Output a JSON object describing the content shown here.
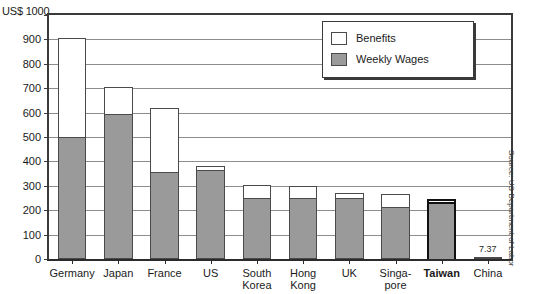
{
  "chart_data": {
    "type": "bar",
    "stacked": true,
    "title": "",
    "subtitle": "",
    "xlabel": "",
    "ylabel": "US$ 1000",
    "ylim": [
      0,
      1000
    ],
    "ytick_step": 100,
    "yticks": [
      0,
      100,
      200,
      300,
      400,
      500,
      600,
      700,
      800,
      900,
      1000
    ],
    "ytick_labels": [
      "0",
      "100",
      "200",
      "300",
      "400",
      "500",
      "600",
      "700",
      "800",
      "900",
      "1000"
    ],
    "grid": true,
    "grid_axis": "y",
    "legend_position": "top-right",
    "categories": [
      "Germany",
      "Japan",
      "France",
      "US",
      "South\nKorea",
      "Hong\nKong",
      "UK",
      "Singa-\npore",
      "Taiwan",
      "China"
    ],
    "series": [
      {
        "name": "Weekly Wages",
        "color": "#9a9a9a",
        "values": [
          500,
          595,
          355,
          365,
          250,
          250,
          250,
          215,
          235,
          7.37
        ]
      },
      {
        "name": "Benefits",
        "color": "#ffffff",
        "values": [
          405,
          110,
          265,
          15,
          55,
          50,
          20,
          50,
          10,
          0
        ]
      }
    ],
    "totals": [
      905,
      705,
      620,
      380,
      305,
      300,
      270,
      265,
      245,
      7.37
    ],
    "annotations": [
      {
        "category": "China",
        "label": "7.37"
      }
    ],
    "highlight_category": "Taiwan",
    "source": "Source: US Department of Labor"
  },
  "legend": {
    "items": [
      {
        "label": "Benefits",
        "swatch": "#ffffff"
      },
      {
        "label": "Weekly Wages",
        "swatch": "#9a9a9a"
      }
    ]
  },
  "axis": {
    "y_title": "US$ 1000"
  },
  "source_note": "Source: US Department of Labor"
}
